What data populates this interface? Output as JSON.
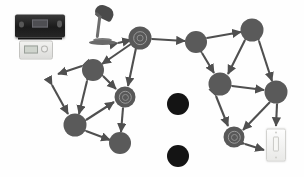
{
  "scene": {
    "title": "Smart home device mesh network diagram",
    "background": "#ffffff",
    "width": 304,
    "height": 177
  },
  "palette": {
    "node_gray": "#5a5a5a",
    "node_black": "#141414",
    "edge_gray": "#4f4f4f",
    "device_dark": "#262626",
    "device_light": "#f2f2f0"
  },
  "legend": {
    "connected_label": "Connected device node",
    "isolated_label": "Isolated device node",
    "link_label": "Bidirectional link"
  },
  "nodes": [
    {
      "id": "n1",
      "name": "node-hub-lamp-link",
      "x": 140,
      "y": 38,
      "r": 11.5,
      "style": "ring",
      "state": "connected"
    },
    {
      "id": "n2",
      "name": "node-upper-left",
      "x": 93,
      "y": 70,
      "r": 11.0,
      "style": "plain",
      "state": "connected"
    },
    {
      "id": "n3",
      "name": "node-left-mid",
      "x": 75,
      "y": 125,
      "r": 11.5,
      "style": "plain",
      "state": "connected"
    },
    {
      "id": "n4",
      "name": "node-center-speaker",
      "x": 125,
      "y": 97,
      "r": 10.5,
      "style": "ring",
      "state": "connected"
    },
    {
      "id": "n5",
      "name": "node-lower-center",
      "x": 120,
      "y": 143,
      "r": 11.0,
      "style": "plain",
      "state": "connected"
    },
    {
      "id": "n6",
      "name": "node-upper-center",
      "x": 196,
      "y": 42,
      "r": 11.0,
      "style": "plain",
      "state": "connected"
    },
    {
      "id": "n7",
      "name": "node-upper-right",
      "x": 252,
      "y": 30,
      "r": 11.5,
      "style": "plain",
      "state": "connected"
    },
    {
      "id": "n8",
      "name": "node-right-mid",
      "x": 220,
      "y": 84,
      "r": 11.5,
      "style": "plain",
      "state": "connected"
    },
    {
      "id": "n9",
      "name": "node-far-right",
      "x": 276,
      "y": 92,
      "r": 11.5,
      "style": "plain",
      "state": "connected"
    },
    {
      "id": "n10",
      "name": "node-lower-right-sensor",
      "x": 234,
      "y": 137,
      "r": 10.5,
      "style": "ring",
      "state": "connected"
    },
    {
      "id": "n11",
      "name": "node-isolated-upper",
      "x": 178,
      "y": 104,
      "r": 11.0,
      "style": "dark",
      "state": "isolated"
    },
    {
      "id": "n12",
      "name": "node-isolated-lower",
      "x": 178,
      "y": 156,
      "r": 11.0,
      "style": "dark",
      "state": "isolated"
    }
  ],
  "edges": [
    {
      "name": "edge-lamp-to-n1",
      "from": [
        118,
        43
      ],
      "to": [
        131,
        40
      ]
    },
    {
      "name": "edge-n1-n2",
      "from": [
        131,
        44
      ],
      "to": [
        102,
        64
      ]
    },
    {
      "name": "edge-n1-n6",
      "from": [
        152,
        39
      ],
      "to": [
        185,
        41
      ]
    },
    {
      "name": "edge-n1-n4",
      "from": [
        136,
        48
      ],
      "to": [
        128,
        86
      ]
    },
    {
      "name": "edge-n2-n3",
      "from": [
        87,
        81
      ],
      "to": [
        79,
        114
      ]
    },
    {
      "name": "edge-n2-left",
      "from": [
        82,
        66
      ],
      "to": [
        58,
        74
      ]
    },
    {
      "name": "edge-n2-n4",
      "from": [
        103,
        76
      ],
      "to": [
        116,
        89
      ]
    },
    {
      "name": "edge-left-n3",
      "from": [
        52,
        85
      ],
      "to": [
        68,
        114
      ]
    },
    {
      "name": "edge-n3-n5",
      "from": [
        86,
        131
      ],
      "to": [
        110,
        140
      ]
    },
    {
      "name": "edge-n3-n4",
      "from": [
        86,
        120
      ],
      "to": [
        114,
        102
      ]
    },
    {
      "name": "edge-n4-n5",
      "from": [
        123,
        108
      ],
      "to": [
        121,
        132
      ]
    },
    {
      "name": "edge-n6-n7",
      "from": [
        207,
        38
      ],
      "to": [
        241,
        32
      ]
    },
    {
      "name": "edge-n6-n8",
      "from": [
        202,
        53
      ],
      "to": [
        214,
        73
      ]
    },
    {
      "name": "edge-n7-n8",
      "from": [
        245,
        40
      ],
      "to": [
        228,
        74
      ]
    },
    {
      "name": "edge-n7-n9",
      "from": [
        259,
        41
      ],
      "to": [
        272,
        81
      ]
    },
    {
      "name": "edge-n8-n9",
      "from": [
        232,
        86
      ],
      "to": [
        264,
        90
      ]
    },
    {
      "name": "edge-n8-n10",
      "from": [
        216,
        96
      ],
      "to": [
        228,
        126
      ]
    },
    {
      "name": "edge-n9-n10",
      "from": [
        270,
        102
      ],
      "to": [
        243,
        130
      ]
    },
    {
      "name": "edge-n9-switch",
      "from": [
        277,
        104
      ],
      "to": [
        276,
        126
      ]
    },
    {
      "name": "edge-n10-switch",
      "from": [
        245,
        144
      ],
      "to": [
        264,
        150
      ]
    }
  ],
  "devices": [
    {
      "id": "d1",
      "name": "av-receiver",
      "label": "AV receiver",
      "x": 40,
      "y": 26
    },
    {
      "id": "d2",
      "name": "remote-control-panel",
      "label": "Remote control panel",
      "x": 36,
      "y": 50
    },
    {
      "id": "d3",
      "name": "desk-lamp",
      "label": "Desk lamp",
      "x": 104,
      "y": 26
    },
    {
      "id": "d4",
      "name": "wall-light-switch",
      "label": "Wall light switch",
      "x": 276,
      "y": 145
    }
  ]
}
